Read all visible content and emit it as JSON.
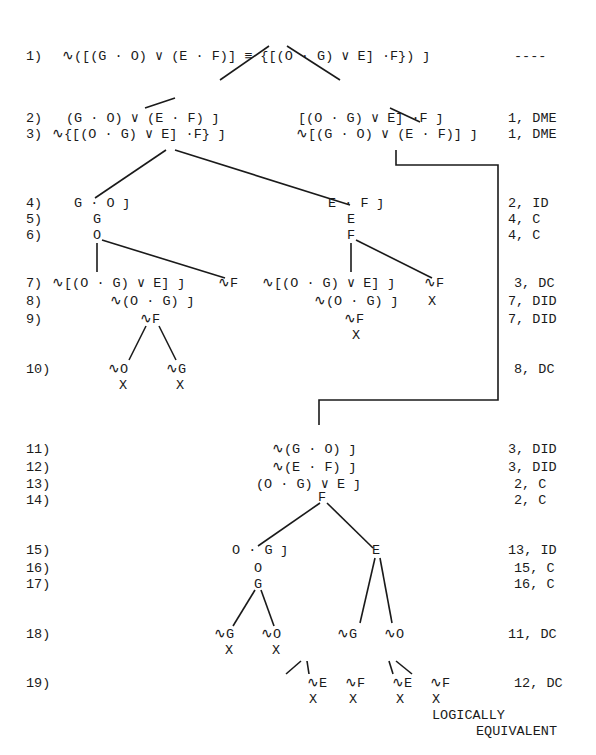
{
  "lines": [
    {
      "num": "1)",
      "formulas": [
        "∿([(G · O) ∨ (E · F)] ≡ {[(O · G) ∨ E] ·F}) ȷ"
      ],
      "justification": "----"
    },
    {
      "num": "2)",
      "formulas": [
        "(G · O) ∨ (E · F) ȷ",
        "[(O · G) ∨ E] ·F ȷ"
      ],
      "justification": "1, DME"
    },
    {
      "num": "3)",
      "formulas": [
        "∿{[(O · G) ∨ E] ·F} ȷ",
        "∿[(G · O) ∨ (E · F)] ȷ"
      ],
      "justification": "1, DME"
    },
    {
      "num": "4)",
      "formulas": [
        "G · O ȷ",
        "E · F ȷ"
      ],
      "justification": "2, ID"
    },
    {
      "num": "5)",
      "formulas": [
        "G",
        "E"
      ],
      "justification": "4, C"
    },
    {
      "num": "6)",
      "formulas": [
        "O",
        "F"
      ],
      "justification": "4, C"
    },
    {
      "num": "7)",
      "formulas": [
        "∿[(O · G) ∨ E] ȷ",
        "∿F",
        "∿[(O · G) ∨ E] ȷ",
        "∿F"
      ],
      "justification": "3, DC"
    },
    {
      "num": "8)",
      "formulas": [
        "∿(O · G) ȷ",
        "∿(O · G) ȷ",
        "X"
      ],
      "justification": "7, DID"
    },
    {
      "num": "9)",
      "formulas": [
        "∿F",
        "∿F",
        "X"
      ],
      "justification": "7, DID"
    },
    {
      "num": "10)",
      "formulas": [
        "∿O",
        "X",
        "∿G",
        "X"
      ],
      "justification": "8, DC"
    },
    {
      "num": "11)",
      "formulas": [
        "∿(G · O) ȷ"
      ],
      "justification": "3, DID"
    },
    {
      "num": "12)",
      "formulas": [
        "∿(E · F) ȷ"
      ],
      "justification": "3, DID"
    },
    {
      "num": "13)",
      "formulas": [
        "(O · G) ∨ E ȷ"
      ],
      "justification": "2, C"
    },
    {
      "num": "14)",
      "formulas": [
        "F"
      ],
      "justification": "2, C"
    },
    {
      "num": "15)",
      "formulas": [
        "O · G ȷ",
        "E"
      ],
      "justification": "13, ID"
    },
    {
      "num": "16)",
      "formulas": [
        "O"
      ],
      "justification": "15, C"
    },
    {
      "num": "17)",
      "formulas": [
        "G"
      ],
      "justification": "16, C"
    },
    {
      "num": "18)",
      "formulas": [
        "∿G",
        "X",
        "∿O",
        "X",
        "∿G",
        "∿O"
      ],
      "justification": "11, DC"
    },
    {
      "num": "19)",
      "formulas": [
        "∿E",
        "X",
        "∿F",
        "X",
        "∿E",
        "X",
        "∿F",
        "X"
      ],
      "justification": "12, DC"
    }
  ],
  "conclusion": {
    "line1": "LOGICALLY",
    "line2": "EQUIVALENT"
  }
}
